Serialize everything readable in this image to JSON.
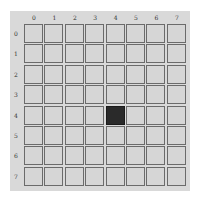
{
  "board": {
    "rows": 8,
    "cols": 8,
    "col_labels": [
      "0",
      "1",
      "2",
      "3",
      "4",
      "5",
      "6",
      "7"
    ],
    "row_labels": [
      "0",
      "1",
      "2",
      "3",
      "4",
      "5",
      "6",
      "7"
    ],
    "filled_cells": [
      {
        "row": 4,
        "col": 4
      }
    ],
    "colors": {
      "panel": "#d9d9d9",
      "cell": "#d6d6d6",
      "cell_border": "#6b6b6b",
      "filled": "#2a2a2a"
    }
  }
}
